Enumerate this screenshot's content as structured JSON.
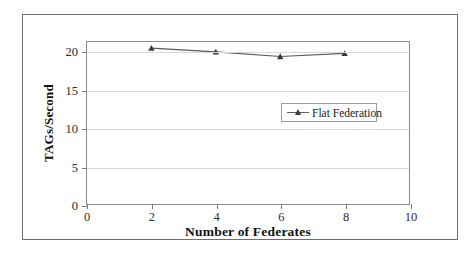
{
  "chart_data": {
    "type": "line",
    "title": "",
    "xlabel": "Number of Federates",
    "ylabel": "TAGs/Second",
    "xlim": [
      0,
      10
    ],
    "ylim": [
      0,
      21.3
    ],
    "xticks": [
      "0",
      "2",
      "4",
      "6",
      "8",
      "10"
    ],
    "yticks": [
      "0",
      "5",
      "10",
      "15",
      "20"
    ],
    "xtick_values": [
      0,
      2,
      4,
      6,
      8,
      10
    ],
    "ytick_values": [
      0,
      5,
      10,
      15,
      20
    ],
    "grid": "horizontal",
    "legend_position": "center-right",
    "x": [
      2,
      4,
      6,
      8
    ],
    "series": [
      {
        "name": "Flat Federation",
        "values": [
          20.5,
          20.0,
          19.4,
          19.8
        ],
        "marker": "triangle",
        "color": "#5a5a5a"
      }
    ]
  },
  "legend": {
    "entries": [
      {
        "label": "Flat Federation"
      }
    ]
  },
  "axes": {
    "x_title": "Number of Federates",
    "y_title": "TAGs/Second"
  },
  "colors": {
    "gridline": "#d9d9d9",
    "axis": "#8c8c8c",
    "frame": "#6e6e6e",
    "series": "#5a5a5a",
    "text": "#1a1a1a",
    "background": "#ffffff"
  }
}
